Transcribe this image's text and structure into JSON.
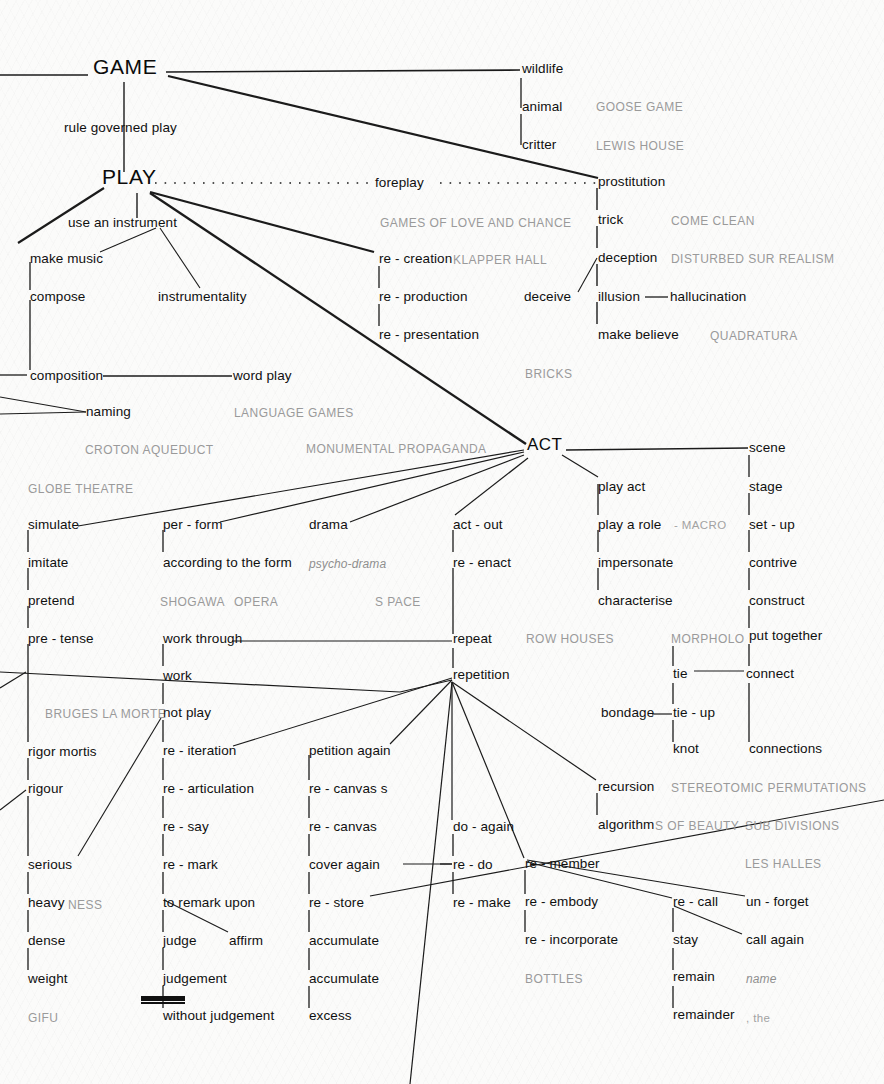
{
  "diagram": {
    "ink_color": "#1b1b1b",
    "faint_color": "#9a9a9a",
    "background_color": "#fbfbfa"
  },
  "nodes": {
    "game": "GAME",
    "play": "PLAY",
    "act": "ACT"
  },
  "labels": {
    "rule_governed_play": "rule governed play",
    "use_an_instrument": "use an instrument",
    "make_music": "make music",
    "compose": "compose",
    "instrumentality": "instrumentality",
    "composition": "composition",
    "word_play": "word play",
    "naming": "naming",
    "foreplay": "foreplay",
    "wildlife": "wildlife",
    "animal": "animal",
    "critter": "critter",
    "prostitution": "prostitution",
    "trick": "trick",
    "deception": "deception",
    "deceive": "deceive",
    "illusion": "illusion",
    "hallucination": "hallucination",
    "make_believe": "make believe",
    "re_creation": "re - creation",
    "re_production": "re - production",
    "re_presentation": "re - presentation",
    "simulate": "simulate",
    "imitate": "imitate",
    "pretend": "pretend",
    "pre_tense": "pre - tense",
    "rigor_mortis": "rigor mortis",
    "rigour": "rigour",
    "serious": "serious",
    "heavy": "heavy",
    "dense": "dense",
    "weight": "weight",
    "per_form": "per - form",
    "according_to_the_form": "according to the form",
    "work_through": "work through",
    "work": "work",
    "not_play": "not play",
    "re_iteration": "re - iteration",
    "re_articulation": "re - articulation",
    "re_say": "re - say",
    "re_mark": "re - mark",
    "to_remark_upon": "to remark upon",
    "judge": "judge",
    "affirm": "affirm",
    "judgement": "judgement",
    "without_judgement": "without judgement",
    "drama": "drama",
    "petition_again": "petition again",
    "re_canvas_s": "re - canvas s",
    "re_canvas": "re - canvas",
    "cover_again": "cover again",
    "re_store": "re - store",
    "accumulate_1": "accumulate",
    "accumulate_2": "accumulate",
    "excess": "excess",
    "act_out": "act - out",
    "re_enact": "re - enact",
    "repeat": "repeat",
    "repetition": "repetition",
    "do_again": "do - again",
    "re_do": "re - do",
    "re_make": "re - make",
    "play_act": "play act",
    "play_a_role": "play a role",
    "impersonate": "impersonate",
    "characterise": "characterise",
    "recursion": "recursion",
    "algorithm": "algorithm",
    "re_member": "re - member",
    "re_embody": "re - embody",
    "re_incorporate": "re - incorporate",
    "tie": "tie",
    "bondage": "bondage",
    "tie_up": "tie - up",
    "knot": "knot",
    "re_call": "re - call",
    "stay": "stay",
    "remain": "remain",
    "remainder": "remainder",
    "scene": "scene",
    "stage": "stage",
    "set_up": "set - up",
    "contrive": "contrive",
    "construct": "construct",
    "put_together": "put together",
    "connect": "connect",
    "connections": "connections",
    "un_forget": "un - forget",
    "call_again": "call again"
  },
  "faint_labels": {
    "goose_game": "GOOSE GAME",
    "lewis_house": "LEWIS HOUSE",
    "come_clean": "COME CLEAN",
    "disturbed_sur_realism": "DISTURBED SUR REALISM",
    "quadratura": "QUADRATURA",
    "games_of_love_and_chance": "GAMES OF LOVE AND CHANCE",
    "klapper_hall": "KLAPPER HALL",
    "bricks": "BRICKS",
    "language_games": "LANGUAGE GAMES",
    "croton_aqueduct": "CROTON AQUEDUCT",
    "monumental_propaganda": "MONUMENTAL PROPAGANDA",
    "globe_theatre": "GLOBE THEATRE",
    "shogawa": "SHOGAWA",
    "opera": "OPERA",
    "s_pace": "S PACE",
    "psycho_drama": "psycho-drama",
    "macro": "- MACRO",
    "row_houses": "ROW HOUSES",
    "morpholo": "MORPHOLO",
    "bruges_la_morte": "BRUGES LA MORTE",
    "stereotomic_permutations": "STEREOTOMIC PERMUTATIONS",
    "s_of_beauty": "S OF BEAUTY",
    "sub_divisions": "SUB DIVISIONS",
    "les_halles": "LES HALLES",
    "bottles": "BOTTLES",
    "ness": "NESS",
    "gifu": "GIFU",
    "name": "name",
    "the": ", the"
  }
}
